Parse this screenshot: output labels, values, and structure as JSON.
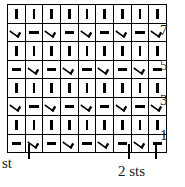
{
  "chart": {
    "columns": 9,
    "rows": 8,
    "symbols": {
      "bar": "|",
      "vee": "V",
      "dash": "—"
    },
    "symbol_names": {
      "bar": "knit-stitch-bar",
      "vee": "slip-stitch-vee",
      "dash": "purl-stitch-dash"
    },
    "grid": [
      [
        "bar",
        "bar",
        "bar",
        "bar",
        "bar",
        "bar",
        "bar",
        "bar",
        "bar"
      ],
      [
        "vee",
        "dash",
        "vee",
        "dash",
        "vee",
        "dash",
        "vee",
        "dash",
        "vee"
      ],
      [
        "bar",
        "bar",
        "bar",
        "bar",
        "bar",
        "bar",
        "bar",
        "bar",
        "bar"
      ],
      [
        "dash",
        "vee",
        "dash",
        "vee",
        "dash",
        "vee",
        "dash",
        "vee",
        "dash"
      ],
      [
        "bar",
        "bar",
        "bar",
        "bar",
        "bar",
        "bar",
        "bar",
        "bar",
        "bar"
      ],
      [
        "vee",
        "dash",
        "vee",
        "dash",
        "vee",
        "dash",
        "vee",
        "dash",
        "vee"
      ],
      [
        "bar",
        "bar",
        "bar",
        "bar",
        "bar",
        "bar",
        "bar",
        "bar",
        "bar"
      ],
      [
        "dash",
        "vee",
        "dash",
        "vee",
        "dash",
        "vee",
        "dash",
        "vee",
        "dash"
      ]
    ],
    "row_numbers": [
      {
        "label": "7",
        "row_index": 1
      },
      {
        "label": "5",
        "row_index": 3
      },
      {
        "label": "3",
        "row_index": 5
      },
      {
        "label": "1",
        "row_index": 7
      }
    ],
    "ruler": {
      "ticks_x": [
        28,
        128,
        155
      ],
      "captions": {
        "left": "st",
        "right": "2 sts"
      }
    },
    "colors": {
      "ink": "#000000",
      "text": "#1a1a1a",
      "cell_background": "#ffffff",
      "page_background": "#ffffff"
    }
  }
}
